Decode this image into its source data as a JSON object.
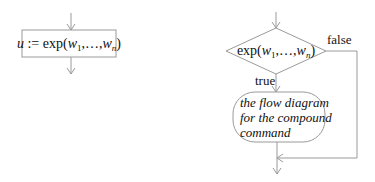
{
  "left_diagram": {
    "assignment": {
      "var": "u",
      "op": " := ",
      "func": "exp(",
      "arg1": "w",
      "arg1_sub": "1",
      "sep": ",…,",
      "argn": "w",
      "argn_sub": "n",
      "close": ")"
    }
  },
  "right_diagram": {
    "condition": {
      "func": "exp(",
      "arg1": "w",
      "arg1_sub": "1",
      "sep": ",…,",
      "argn": "w",
      "argn_sub": "n",
      "close": ")"
    },
    "false_label": "false",
    "true_label": "true",
    "body_lines": [
      "the flow diagram",
      "for the compound",
      "command"
    ]
  },
  "colors": {
    "line": "#9a9a9a",
    "text": "#111111"
  }
}
